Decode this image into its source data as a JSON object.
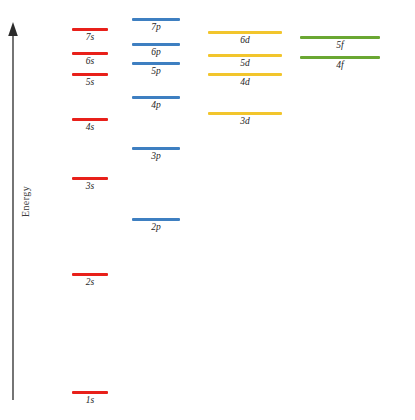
{
  "figure": {
    "axis": {
      "label": "Energy",
      "direction": "up",
      "arrow_top_y": 25,
      "arrow_bottom_y": 400,
      "x": 13,
      "color": "#3a3a3a"
    },
    "background": "#ffffff"
  },
  "chart_data": {
    "type": "scatter",
    "title": "",
    "subtitle": "",
    "xlabel": "",
    "ylabel": "Energy",
    "grid": false,
    "legend_position": "none",
    "note": "Relative energies of atomic orbitals; y is screen pixel position of each level line (smaller y = higher energy).",
    "columns": [
      {
        "name": "s orbitals",
        "color": "#e8201a",
        "x_start": 72,
        "x_end": 108,
        "levels": [
          {
            "label": "7s",
            "y": 28
          },
          {
            "label": "6s",
            "y": 52
          },
          {
            "label": "5s",
            "y": 73
          },
          {
            "label": "4s",
            "y": 118
          },
          {
            "label": "3s",
            "y": 177
          },
          {
            "label": "2s",
            "y": 273
          },
          {
            "label": "1s",
            "y": 391
          }
        ]
      },
      {
        "name": "p orbitals",
        "color": "#3e7fc1",
        "x_start": 132,
        "x_end": 180,
        "levels": [
          {
            "label": "7p",
            "y": 18
          },
          {
            "label": "6p",
            "y": 43
          },
          {
            "label": "5p",
            "y": 62
          },
          {
            "label": "4p",
            "y": 96
          },
          {
            "label": "3p",
            "y": 147
          },
          {
            "label": "2p",
            "y": 218
          }
        ]
      },
      {
        "name": "d orbitals",
        "color": "#f2c52c",
        "x_start": 208,
        "x_end": 282,
        "levels": [
          {
            "label": "6d",
            "y": 31
          },
          {
            "label": "5d",
            "y": 54
          },
          {
            "label": "4d",
            "y": 73
          },
          {
            "label": "3d",
            "y": 112
          }
        ]
      },
      {
        "name": "f orbitals",
        "color": "#6aa732",
        "x_start": 300,
        "x_end": 380,
        "levels": [
          {
            "label": "5f",
            "y": 36
          },
          {
            "label": "4f",
            "y": 56
          }
        ]
      }
    ]
  }
}
